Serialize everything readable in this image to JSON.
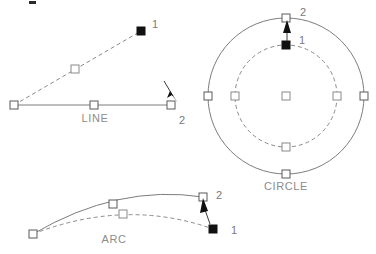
{
  "diagram": {
    "colors": {
      "geometry_solid": "#7d7d7d",
      "geometry_dashed": "#8a8a8a",
      "grip_stroke": "#5a5a5a",
      "grip_fill_hot": "#111111",
      "grip_fill_cold": "#ffffff",
      "label_text": "#8c8c8c",
      "point_text": "#7a7a7a",
      "arrow": "#111111",
      "background": "#ffffff"
    },
    "objects": [
      {
        "id": "line",
        "caption": "LINE",
        "caption_pos": {
          "x": 95,
          "y": 122
        },
        "point_labels": [
          {
            "text": "1",
            "x": 152,
            "y": 28
          },
          {
            "text": "2",
            "x": 179,
            "y": 124
          }
        ],
        "solid_geometry": {
          "start": {
            "x": 14,
            "y": 105
          },
          "mid": {
            "x": 94,
            "y": 105
          },
          "end": {
            "x": 171,
            "y": 105
          }
        },
        "dashed_geometry": {
          "start": {
            "x": 14,
            "y": 105
          },
          "mid": {
            "x": 75,
            "y": 69
          },
          "end": {
            "x": 141,
            "y": 31
          }
        },
        "grips": [
          {
            "x": 14,
            "y": 105,
            "state": "cold"
          },
          {
            "x": 94,
            "y": 105,
            "state": "cold"
          },
          {
            "x": 171,
            "y": 105,
            "state": "cold"
          },
          {
            "x": 75,
            "y": 69,
            "state": "cold"
          },
          {
            "x": 141,
            "y": 31,
            "state": "hot"
          }
        ],
        "drag_arrow": {
          "x1": 165,
          "y1": 84,
          "x2": 176,
          "y2": 101
        }
      },
      {
        "id": "circle",
        "caption": "CIRCLE",
        "caption_pos": {
          "x": 286,
          "y": 190
        },
        "point_labels": [
          {
            "text": "1",
            "x": 299,
            "y": 44
          },
          {
            "text": "2",
            "x": 300,
            "y": 16
          }
        ],
        "solid_geometry": {
          "center": {
            "x": 286,
            "y": 96
          },
          "radius": 78
        },
        "dashed_geometry": {
          "center": {
            "x": 286,
            "y": 96
          },
          "radius": 51
        },
        "grips": [
          {
            "x": 286,
            "y": 96,
            "state": "cold"
          },
          {
            "x": 286,
            "y": 18,
            "state": "cold"
          },
          {
            "x": 208,
            "y": 96,
            "state": "cold"
          },
          {
            "x": 364,
            "y": 96,
            "state": "cold"
          },
          {
            "x": 286,
            "y": 174,
            "state": "cold"
          },
          {
            "x": 235,
            "y": 96,
            "state": "cold"
          },
          {
            "x": 337,
            "y": 96,
            "state": "cold"
          },
          {
            "x": 286,
            "y": 147,
            "state": "cold"
          },
          {
            "x": 286,
            "y": 45,
            "state": "hot"
          }
        ],
        "drag_arrow": {
          "x1": 287,
          "y1": 41,
          "x2": 287,
          "y2": 22
        }
      },
      {
        "id": "arc",
        "caption": "ARC",
        "caption_pos": {
          "x": 114,
          "y": 243
        },
        "point_labels": [
          {
            "text": "1",
            "x": 231,
            "y": 234
          },
          {
            "text": "2",
            "x": 216,
            "y": 199
          }
        ],
        "solid_geometry": {
          "start": {
            "x": 33,
            "y": 234
          },
          "control": {
            "x": 118,
            "y": 184
          },
          "end": {
            "x": 203,
            "y": 197
          }
        },
        "dashed_geometry": {
          "start": {
            "x": 33,
            "y": 234
          },
          "control": {
            "x": 126,
            "y": 198
          },
          "end": {
            "x": 213,
            "y": 229
          }
        },
        "grips": [
          {
            "x": 33,
            "y": 234,
            "state": "cold"
          },
          {
            "x": 113,
            "y": 204,
            "state": "cold"
          },
          {
            "x": 203,
            "y": 197,
            "state": "cold"
          },
          {
            "x": 123,
            "y": 214,
            "state": "cold"
          },
          {
            "x": 213,
            "y": 229,
            "state": "hot"
          }
        ],
        "drag_arrow": {
          "x1": 208,
          "y1": 219,
          "x2": 203,
          "y2": 202
        }
      }
    ],
    "stray_mark": {
      "x": 29,
      "y": 1,
      "width": 7,
      "height": 3
    }
  }
}
